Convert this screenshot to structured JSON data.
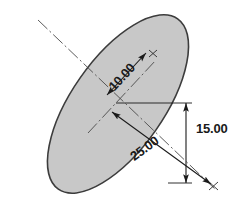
{
  "drawing": {
    "type": "engineering-dimension-drawing",
    "shape": "ellipse",
    "background_color": "#ffffff",
    "fill_color": "#c8c8c8",
    "outline_color": "#3c3c3c",
    "annotation_color": "#1a1a1a",
    "canvas": {
      "width": 245,
      "height": 209
    },
    "ellipse": {
      "center_x": 118,
      "center_y": 104,
      "semi_major_px": 104,
      "semi_minor_px": 46,
      "rotation_deg": -55
    },
    "dimensions": [
      {
        "name": "minor-semi-axis",
        "label": "10.00",
        "label_x": 125,
        "label_y": 80,
        "style": "aligned",
        "arrowheads": "both",
        "from_x": 107,
        "from_y": 95,
        "to_x": 146,
        "to_y": 53
      },
      {
        "name": "major-semi-axis",
        "label": "25.00",
        "label_x": 143,
        "label_y": 155,
        "style": "aligned",
        "arrowheads": "both",
        "from_x": 112,
        "from_y": 112,
        "to_x": 211,
        "to_y": 184
      },
      {
        "name": "vertical-offset",
        "label": "15.00",
        "label_x": 196,
        "label_y": 133,
        "style": "linear-vertical",
        "arrowheads": "both",
        "from_x": 186,
        "from_y": 103,
        "to_x": 186,
        "to_y": 183
      }
    ],
    "centerlines": [
      {
        "name": "major-axis-centerline",
        "x1": 38,
        "y1": 20,
        "x2": 216,
        "y2": 190
      },
      {
        "name": "minor-axis-centerline",
        "x1": 88,
        "y1": 133,
        "x2": 156,
        "y2": 60
      }
    ],
    "endpoint_markers": [
      {
        "name": "minor-axis-endpoint",
        "x": 153,
        "y": 53
      },
      {
        "name": "major-axis-endpoint",
        "x": 213,
        "y": 186
      }
    ]
  }
}
